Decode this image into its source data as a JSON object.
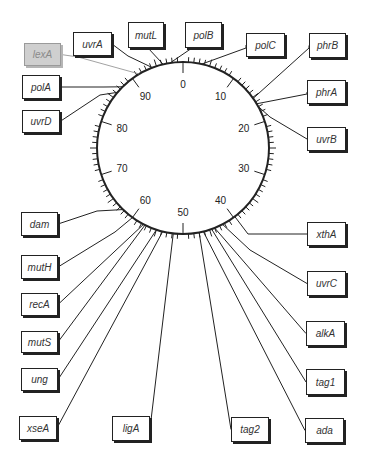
{
  "map": {
    "type": "circular genetic map",
    "center": [
      183,
      148
    ],
    "radius": 86,
    "scale_min": 0,
    "scale_max": 100,
    "major_tick_step": 10,
    "minor_tick_step": 1,
    "tick_labels": [
      "0",
      "10",
      "20",
      "30",
      "40",
      "50",
      "60",
      "70",
      "80",
      "90"
    ]
  },
  "genes": [
    {
      "id": "lexA",
      "label": "lexA",
      "pos": 91.5,
      "box": [
        24,
        43,
        37,
        23
      ],
      "faded": true,
      "elbow": [
        78,
        57
      ]
    },
    {
      "id": "uvrA",
      "label": "uvrA",
      "pos": 94.2,
      "box": [
        73,
        32,
        39,
        24
      ],
      "elbow": [
        128,
        56
      ]
    },
    {
      "id": "mutL",
      "label": "mutL",
      "pos": 96.3,
      "box": [
        128,
        22,
        36,
        26
      ],
      "elbow": [
        148,
        48
      ]
    },
    {
      "id": "polB",
      "label": "polB",
      "pos": 97.6,
      "box": [
        185,
        22,
        37,
        26
      ],
      "elbow": [
        192,
        48
      ]
    },
    {
      "id": "polC",
      "label": "polC",
      "pos": 3.5,
      "box": [
        246,
        33,
        39,
        24
      ],
      "elbow": [
        246,
        48
      ]
    },
    {
      "id": "phrB",
      "label": "phrB",
      "pos": 15.2,
      "box": [
        309,
        33,
        37,
        25
      ],
      "elbow": [
        309,
        48
      ]
    },
    {
      "id": "phrA",
      "label": "phrA",
      "pos": 16.4,
      "box": [
        307,
        80,
        39,
        24
      ],
      "elbow": [
        307,
        94
      ]
    },
    {
      "id": "uvrB",
      "label": "uvrB",
      "pos": 17.0,
      "box": [
        307,
        127,
        39,
        24
      ],
      "elbow": [
        270,
        117
      ]
    },
    {
      "id": "polA",
      "label": "polA",
      "pos": 87.6,
      "box": [
        22,
        75,
        38,
        24
      ],
      "elbow": [
        104,
        87
      ]
    },
    {
      "id": "uvrD",
      "label": "uvrD",
      "pos": 86.2,
      "box": [
        22,
        110,
        38,
        23
      ],
      "elbow": [
        100,
        95
      ]
    },
    {
      "id": "dam",
      "label": "dam",
      "pos": 62.3,
      "box": [
        21,
        212,
        37,
        24
      ],
      "elbow": [
        97,
        211
      ]
    },
    {
      "id": "mutH",
      "label": "mutH",
      "pos": 60.0,
      "box": [
        21,
        255,
        37,
        24
      ],
      "elbow": [
        115,
        232
      ]
    },
    {
      "id": "recA",
      "label": "recA",
      "pos": 57.6,
      "box": [
        21,
        293,
        37,
        23
      ]
    },
    {
      "id": "mutS",
      "label": "mutS",
      "pos": 57.3,
      "box": [
        21,
        331,
        37,
        22
      ]
    },
    {
      "id": "ung",
      "label": "ung",
      "pos": 55.0,
      "box": [
        21,
        368,
        37,
        23
      ]
    },
    {
      "id": "xseA",
      "label": "xseA",
      "pos": 53.8,
      "box": [
        19,
        416,
        38,
        24
      ]
    },
    {
      "id": "ligA",
      "label": "ligA",
      "pos": 51.8,
      "box": [
        112,
        416,
        38,
        25
      ]
    },
    {
      "id": "tag2",
      "label": "tag2",
      "pos": 47.0,
      "box": [
        231,
        417,
        38,
        25
      ]
    },
    {
      "id": "ada",
      "label": "ada",
      "pos": 46.2,
      "box": [
        305,
        418,
        39,
        25
      ]
    },
    {
      "id": "tag1",
      "label": "tag1",
      "pos": 44.6,
      "box": [
        306,
        369,
        39,
        26
      ]
    },
    {
      "id": "alkA",
      "label": "alkA",
      "pos": 44.0,
      "box": [
        306,
        321,
        39,
        25
      ]
    },
    {
      "id": "uvrC",
      "label": "uvrC",
      "pos": 42.4,
      "box": [
        307,
        271,
        39,
        25
      ],
      "elbow": [
        250,
        250
      ]
    },
    {
      "id": "xthA",
      "label": "xthA",
      "pos": 39.7,
      "box": [
        307,
        222,
        39,
        24
      ],
      "elbow": [
        248,
        234
      ]
    }
  ],
  "colors": {
    "line": "#222222",
    "faded_line": "#8a8a8a",
    "box_border": "#222222",
    "faded_box_fill": "#cfcfcf"
  }
}
